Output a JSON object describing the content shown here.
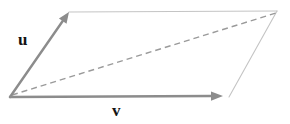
{
  "figure": {
    "kind": "vector-parallelogram-diagram",
    "width": 290,
    "height": 124,
    "background_color": "#ffffff"
  },
  "labels": {
    "u": "u",
    "v": "v",
    "color": "#141414"
  },
  "colors": {
    "vector_stroke": "#8c8c8c",
    "edge_stroke": "#c4c4c4",
    "diagonal_stroke": "#9a9a9a",
    "arrowhead_fill": "#8c8c8c"
  },
  "geometry": {
    "origin": {
      "x": 10,
      "y": 97
    },
    "u_tip": {
      "x": 69,
      "y": 12
    },
    "v_tip": {
      "x": 223,
      "y": 96
    },
    "corner_top_right": {
      "x": 277,
      "y": 11
    },
    "corner_bottom_right": {
      "x": 229,
      "y": 97
    },
    "diagonal_start": {
      "x": 12,
      "y": 95
    },
    "diagonal_end": {
      "x": 276,
      "y": 13
    },
    "vector_stroke_width": 2.4,
    "edge_stroke_width": 1.1,
    "diagonal_stroke_width": 1.4,
    "diagonal_dash_pattern": "6 4"
  },
  "elements": {
    "vector_u_name": "vector-u",
    "vector_v_name": "vector-v",
    "diagonal_name": "diagonal-resultant"
  }
}
